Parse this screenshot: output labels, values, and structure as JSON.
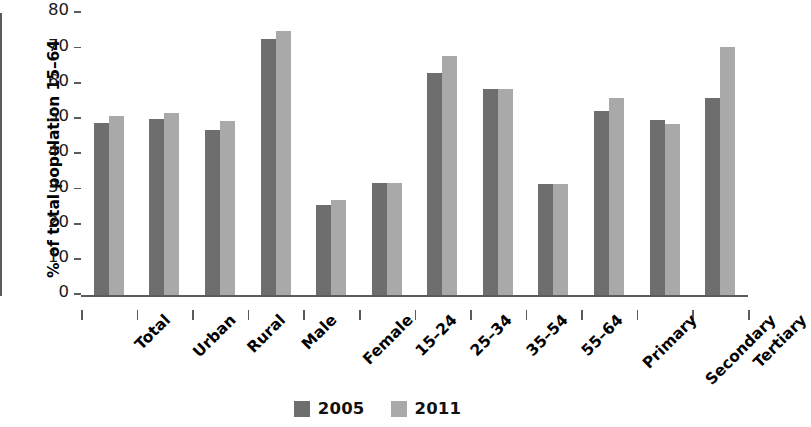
{
  "chart_data": {
    "type": "bar",
    "title": "",
    "subtitle": "",
    "xlabel": "",
    "ylabel": "% of total population 15–64",
    "ylim": [
      0,
      80
    ],
    "yticks": [
      0,
      10,
      20,
      30,
      40,
      50,
      60,
      70,
      80
    ],
    "ytick_labels": [
      "0",
      "10",
      "20",
      "30",
      "40",
      "50",
      "60",
      "70",
      "80"
    ],
    "grid": false,
    "legend_position": "bottom-center",
    "categories": [
      "Total",
      "Urban",
      "Rural",
      "Male",
      "Female",
      "15–24",
      "25–34",
      "35–54",
      "55–64",
      "Primary",
      "Secondary",
      "Tertiary"
    ],
    "series": [
      {
        "name": "2005",
        "color": "#6e6e6e",
        "values": [
          48.8,
          50.0,
          46.7,
          72.7,
          25.6,
          31.9,
          62.9,
          58.4,
          31.5,
          52.3,
          49.7,
          55.8
        ]
      },
      {
        "name": "2011",
        "color": "#a9a9a9",
        "values": [
          50.8,
          51.5,
          49.5,
          75.0,
          27.0,
          31.9,
          67.8,
          58.4,
          31.5,
          56.0,
          48.5,
          70.5
        ]
      }
    ]
  },
  "legend": {
    "items": [
      {
        "label": "2005",
        "color": "#6e6e6e"
      },
      {
        "label": "2011",
        "color": "#a9a9a9"
      }
    ]
  },
  "axis": {
    "y_title": "% of total population 15–64"
  }
}
